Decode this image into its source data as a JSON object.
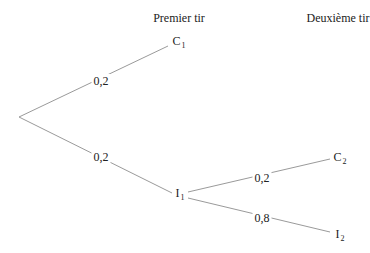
{
  "headers": {
    "first_draw": "Premier tir",
    "second_draw": "Deuxième tir"
  },
  "nodes": {
    "c1": {
      "letter": "C",
      "index": "1"
    },
    "i1": {
      "letter": "I",
      "index": "1"
    },
    "c2": {
      "letter": "C",
      "index": "2"
    },
    "i2": {
      "letter": "I",
      "index": "2"
    }
  },
  "edges": {
    "root_to_c1": "0,2",
    "root_to_i1": "0,2",
    "i1_to_c2": "0,2",
    "i1_to_i2": "0,8"
  },
  "colors": {
    "line": "#9a9a9a",
    "text": "#222222"
  }
}
